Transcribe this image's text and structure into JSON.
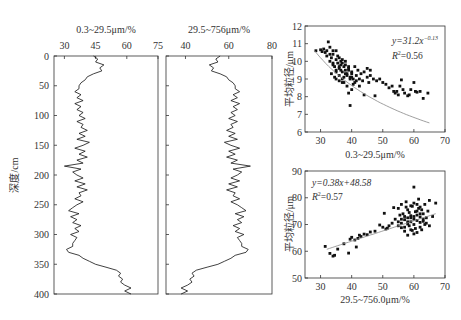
{
  "chart_data": [
    {
      "type": "line",
      "orientation": "depth-profile",
      "title": "0.3~29.5μm/%",
      "xlabel": "0.3~29.5μm/%",
      "ylabel": "深度/cm",
      "xlim": [
        25,
        75
      ],
      "ylim": [
        0,
        400
      ],
      "xticks": [
        30,
        45,
        60,
        75
      ],
      "yticks": [
        0,
        50,
        100,
        150,
        200,
        250,
        300,
        350,
        400
      ],
      "depth": [
        0,
        5,
        10,
        15,
        20,
        25,
        30,
        35,
        40,
        45,
        50,
        55,
        60,
        65,
        70,
        75,
        80,
        85,
        90,
        95,
        100,
        105,
        110,
        115,
        120,
        125,
        130,
        135,
        140,
        145,
        150,
        155,
        160,
        165,
        170,
        175,
        180,
        185,
        190,
        195,
        200,
        205,
        210,
        215,
        220,
        225,
        230,
        235,
        240,
        245,
        250,
        255,
        260,
        265,
        270,
        275,
        280,
        285,
        290,
        295,
        300,
        305,
        310,
        315,
        320,
        325,
        330,
        335,
        340,
        345,
        350,
        355,
        360,
        365,
        370,
        375,
        380,
        385,
        390,
        395,
        400
      ],
      "values": [
        44,
        46,
        45,
        49,
        47,
        48,
        44,
        41,
        40,
        38,
        37,
        37,
        35,
        38,
        36,
        39,
        35,
        38,
        36,
        39,
        37,
        40,
        36,
        39,
        38,
        41,
        37,
        40,
        36,
        42,
        39,
        35,
        40,
        37,
        41,
        36,
        39,
        30,
        38,
        34,
        36,
        39,
        35,
        40,
        36,
        41,
        37,
        38,
        35,
        39,
        36,
        34,
        32,
        37,
        33,
        36,
        34,
        38,
        35,
        37,
        33,
        36,
        35,
        34,
        34,
        31,
        32,
        37,
        39,
        42,
        45,
        50,
        55,
        57,
        56,
        58,
        57,
        59,
        62,
        59,
        62
      ]
    },
    {
      "type": "line",
      "orientation": "depth-profile",
      "title": "29.5~756μm/%",
      "xlabel": "29.5~756μm/%",
      "ylabel": "深度/cm",
      "xlim": [
        31,
        80
      ],
      "ylim": [
        0,
        400
      ],
      "xticks": [
        40,
        60,
        80
      ],
      "yticks": [
        0,
        50,
        100,
        150,
        200,
        250,
        300,
        350,
        400
      ],
      "depth": [
        0,
        5,
        10,
        15,
        20,
        25,
        30,
        35,
        40,
        45,
        50,
        55,
        60,
        65,
        70,
        75,
        80,
        85,
        90,
        95,
        100,
        105,
        110,
        115,
        120,
        125,
        130,
        135,
        140,
        145,
        150,
        155,
        160,
        165,
        170,
        175,
        180,
        185,
        190,
        195,
        200,
        205,
        210,
        215,
        220,
        225,
        230,
        235,
        240,
        245,
        250,
        255,
        260,
        265,
        270,
        275,
        280,
        285,
        290,
        295,
        300,
        305,
        310,
        315,
        320,
        325,
        330,
        335,
        340,
        345,
        350,
        355,
        360,
        365,
        370,
        375,
        380,
        385,
        390,
        395,
        400
      ],
      "values": [
        56,
        54,
        55,
        51,
        53,
        52,
        56,
        59,
        60,
        62,
        63,
        63,
        65,
        62,
        64,
        61,
        65,
        62,
        64,
        61,
        63,
        60,
        64,
        61,
        62,
        59,
        63,
        60,
        64,
        58,
        61,
        65,
        60,
        63,
        59,
        64,
        61,
        70,
        62,
        66,
        64,
        61,
        65,
        60,
        64,
        59,
        63,
        62,
        65,
        61,
        64,
        66,
        68,
        63,
        67,
        64,
        66,
        62,
        65,
        63,
        67,
        64,
        65,
        66,
        66,
        69,
        68,
        63,
        61,
        58,
        55,
        50,
        45,
        43,
        44,
        42,
        43,
        41,
        38,
        41,
        38
      ]
    },
    {
      "type": "scatter",
      "xlabel": "0.3~29.5μm/%",
      "ylabel": "平均粒径/μm",
      "xlim": [
        25,
        70
      ],
      "ylim": [
        6,
        12
      ],
      "xticks": [
        30,
        40,
        50,
        60,
        70
      ],
      "yticks": [
        6,
        7,
        8,
        9,
        10,
        11,
        12
      ],
      "annotation": [
        "y=31.2x-0.13",
        "R²=0.56"
      ],
      "fit": {
        "type": "power",
        "a": 31.2,
        "b": -0.13,
        "r2": 0.56,
        "x_range": [
          28,
          65
        ]
      },
      "points": [
        [
          28.5,
          10.6
        ],
        [
          30,
          10.65
        ],
        [
          30.5,
          10.55
        ],
        [
          31,
          10.7
        ],
        [
          31.5,
          10.5
        ],
        [
          32,
          10.6
        ],
        [
          32.5,
          11.1
        ],
        [
          33,
          10.8
        ],
        [
          33,
          10.4
        ],
        [
          33.5,
          10.2
        ],
        [
          34,
          9.9
        ],
        [
          34,
          10.6
        ],
        [
          34.5,
          9.7
        ],
        [
          35,
          10.1
        ],
        [
          35,
          9.5
        ],
        [
          35.5,
          9.9
        ],
        [
          35.5,
          10.3
        ],
        [
          36,
          9.6
        ],
        [
          36,
          9.2
        ],
        [
          36.5,
          9.8
        ],
        [
          36.5,
          10.0
        ],
        [
          37,
          9.4
        ],
        [
          37,
          9.0
        ],
        [
          37.5,
          9.7
        ],
        [
          37.5,
          8.8
        ],
        [
          38,
          9.5
        ],
        [
          38,
          10.0
        ],
        [
          38.5,
          9.3
        ],
        [
          38.5,
          8.6
        ],
        [
          39,
          9.6
        ],
        [
          39,
          8.2
        ],
        [
          39.5,
          9.1
        ],
        [
          39.5,
          7.5
        ],
        [
          40,
          9.4
        ],
        [
          40,
          8.4
        ],
        [
          40.5,
          9.0
        ],
        [
          41,
          9.7
        ],
        [
          41,
          8.8
        ],
        [
          41.5,
          9.2
        ],
        [
          42,
          9.5
        ],
        [
          42.5,
          9.0
        ],
        [
          43,
          9.3
        ],
        [
          43.5,
          8.9
        ],
        [
          44,
          9.4
        ],
        [
          44,
          8.1
        ],
        [
          45,
          9.1
        ],
        [
          45,
          9.6
        ],
        [
          45.5,
          8.8
        ],
        [
          46,
          9.2
        ],
        [
          46,
          9.5
        ],
        [
          47,
          9.0
        ],
        [
          47.5,
          8.05
        ],
        [
          48,
          8.9
        ],
        [
          49,
          9.0
        ],
        [
          50,
          8.8
        ],
        [
          51,
          8.7
        ],
        [
          52,
          8.5
        ],
        [
          53,
          8.6
        ],
        [
          53.5,
          8.3
        ],
        [
          54,
          8.2
        ],
        [
          54.5,
          8.3
        ],
        [
          55,
          8.1
        ],
        [
          55.5,
          8.6
        ],
        [
          56,
          8.95
        ],
        [
          56.5,
          8.4
        ],
        [
          57,
          8.2
        ],
        [
          58,
          8.05
        ],
        [
          58.5,
          8.1
        ],
        [
          59,
          8.4
        ],
        [
          60,
          8.8
        ],
        [
          60.5,
          8.3
        ],
        [
          61,
          8.25
        ],
        [
          62,
          8.3
        ],
        [
          63,
          7.9
        ],
        [
          64.5,
          8.2
        ],
        [
          33.5,
          9.3
        ],
        [
          34.5,
          9.1
        ],
        [
          35,
          9.0
        ],
        [
          36,
          8.9
        ],
        [
          37,
          8.8
        ],
        [
          34,
          10.4
        ],
        [
          35,
          10.6
        ],
        [
          36,
          10.2
        ],
        [
          37,
          10.1
        ],
        [
          38,
          9.8
        ],
        [
          39,
          9.5
        ],
        [
          40,
          9.3
        ],
        [
          36.5,
          9.5
        ],
        [
          37.5,
          9.1
        ],
        [
          38.5,
          9.2
        ],
        [
          39.5,
          9.0
        ],
        [
          40.5,
          8.7
        ],
        [
          41.5,
          8.9
        ],
        [
          42.5,
          8.6
        ],
        [
          32,
          10.3
        ],
        [
          33,
          10.0
        ],
        [
          34,
          9.8
        ],
        [
          35,
          9.4
        ],
        [
          36,
          9.7
        ],
        [
          37,
          9.9
        ],
        [
          38,
          9.3
        ],
        [
          39,
          9.7
        ],
        [
          40,
          9.1
        ]
      ]
    },
    {
      "type": "scatter",
      "xlabel": "29.5~756.0μm/%",
      "ylabel": "平均粒径/μm",
      "xlim": [
        25,
        70
      ],
      "ylim": [
        50,
        90
      ],
      "xticks": [
        30,
        40,
        50,
        60,
        70
      ],
      "yticks": [
        50,
        60,
        70,
        80,
        90
      ],
      "annotation": [
        "y=0.38x+48.58",
        "R²=0.57"
      ],
      "fit": {
        "type": "linear",
        "a": 0.38,
        "b": 48.58,
        "r2": 0.57,
        "x_range": [
          32,
          67
        ]
      },
      "points": [
        [
          31.5,
          61.8
        ],
        [
          33,
          59.2
        ],
        [
          34,
          58.2
        ],
        [
          34.5,
          58.5
        ],
        [
          35.5,
          60.8
        ],
        [
          37.5,
          62.8
        ],
        [
          39,
          59.3
        ],
        [
          39.5,
          64.5
        ],
        [
          40,
          65.2
        ],
        [
          41,
          64.2
        ],
        [
          41.5,
          61.6
        ],
        [
          42,
          64.8
        ],
        [
          42.5,
          66.0
        ],
        [
          43,
          65.5
        ],
        [
          44,
          66.4
        ],
        [
          45,
          66.2
        ],
        [
          46,
          67.2
        ],
        [
          47.5,
          67.5
        ],
        [
          49,
          69.8
        ],
        [
          50,
          69.0
        ],
        [
          50.5,
          74.2
        ],
        [
          51,
          68.3
        ],
        [
          51.5,
          68.6
        ],
        [
          52,
          69.5
        ],
        [
          53,
          70.5
        ],
        [
          53.5,
          76.3
        ],
        [
          54,
          72.0
        ],
        [
          55,
          71.0
        ],
        [
          55,
          69.5
        ],
        [
          55.5,
          73.5
        ],
        [
          56,
          68.8
        ],
        [
          56,
          70.5
        ],
        [
          56.5,
          74.0
        ],
        [
          57,
          67.5
        ],
        [
          57,
          71.8
        ],
        [
          57.5,
          76.5
        ],
        [
          57.5,
          78.5
        ],
        [
          58,
          70.2
        ],
        [
          58,
          72.5
        ],
        [
          58.5,
          69.5
        ],
        [
          58.5,
          74.5
        ],
        [
          59,
          71.0
        ],
        [
          59,
          73.3
        ],
        [
          59.5,
          67.8
        ],
        [
          59.5,
          76.8
        ],
        [
          60,
          70.0
        ],
        [
          60,
          72.0
        ],
        [
          60,
          84.0
        ],
        [
          60.5,
          74.8
        ],
        [
          60.5,
          68.5
        ],
        [
          61,
          71.5
        ],
        [
          61,
          73.5
        ],
        [
          61.5,
          76.0
        ],
        [
          61.5,
          79.5
        ],
        [
          62,
          70.8
        ],
        [
          62,
          72.8
        ],
        [
          62.5,
          68.0
        ],
        [
          62.5,
          75.5
        ],
        [
          63,
          71.2
        ],
        [
          63,
          74.0
        ],
        [
          63.5,
          70.0
        ],
        [
          63.5,
          77.5
        ],
        [
          64,
          72.5
        ],
        [
          64.5,
          75.0
        ],
        [
          65,
          69.5
        ],
        [
          65,
          79.0
        ],
        [
          66,
          73.0
        ],
        [
          67,
          78.0
        ],
        [
          58,
          66.0
        ],
        [
          59,
          68.0
        ],
        [
          60,
          66.5
        ],
        [
          61,
          67.0
        ],
        [
          62,
          69.0
        ],
        [
          57,
          73.0
        ],
        [
          58,
          75.5
        ],
        [
          59,
          77.0
        ],
        [
          60,
          78.0
        ],
        [
          61,
          77.5
        ],
        [
          62,
          76.5
        ],
        [
          63,
          72.0
        ],
        [
          64,
          70.5
        ],
        [
          56,
          72.0
        ],
        [
          57,
          69.0
        ],
        [
          58,
          71.0
        ],
        [
          59,
          72.5
        ],
        [
          60,
          73.0
        ],
        [
          61,
          75.0
        ],
        [
          62,
          74.0
        ],
        [
          55,
          76.0
        ],
        [
          56,
          77.5
        ]
      ]
    }
  ],
  "panels": {
    "profile_a": {
      "title": "0.3~29.5μm/%",
      "xticks": [
        "30",
        "45",
        "60",
        "75"
      ]
    },
    "profile_b": {
      "title": "29.5~756μm/%",
      "xticks": [
        "40",
        "60",
        "80"
      ]
    },
    "depth_axis_label": "深度/cm",
    "depth_ticks": [
      "0",
      "50",
      "100",
      "150",
      "200",
      "250",
      "300",
      "350",
      "400"
    ],
    "scatter_a": {
      "eq": "y=31.2x",
      "exp": "−0.13",
      "r2_label": "R",
      "r2_value": "=0.56",
      "ylabel": "平均粒径/μm",
      "xlabel": "0.3~29.5μm/%",
      "yticks": [
        "6",
        "7",
        "8",
        "9",
        "10",
        "11",
        "12"
      ],
      "xticks": [
        "30",
        "40",
        "50",
        "60",
        "70"
      ]
    },
    "scatter_b": {
      "eq": "y=0.38x+48.58",
      "r2_label": "R",
      "r2_value": "=0.57",
      "ylabel": "平均粒径/μm",
      "xlabel": "29.5~756.0μm/%",
      "yticks": [
        "50",
        "60",
        "70",
        "80",
        "90"
      ],
      "xticks": [
        "30",
        "40",
        "50",
        "60",
        "70"
      ]
    }
  }
}
